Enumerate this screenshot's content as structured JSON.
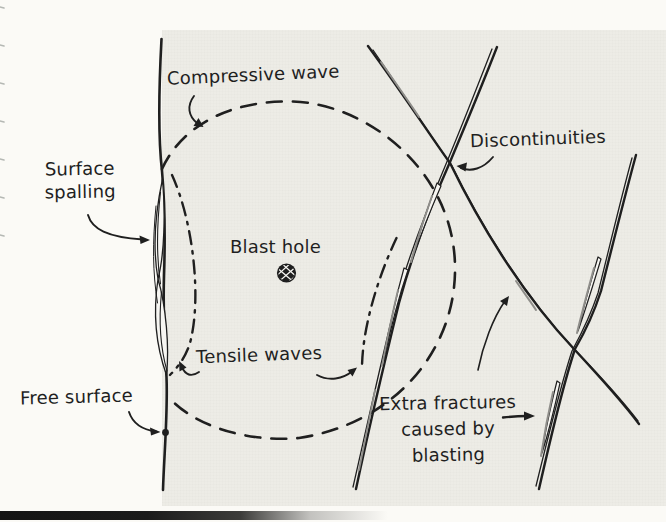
{
  "labels": {
    "compressive_wave": "Compressive wave",
    "discontinuities": "Discontinuities",
    "surface_spalling": {
      "line1": "Surface",
      "line2": "spalling"
    },
    "blast_hole": "Blast hole",
    "tensile_waves": "Tensile waves",
    "free_surface": "Free surface",
    "extra_fractures": {
      "line1": "Extra fractures",
      "line2": "caused by",
      "line3": "blasting"
    }
  },
  "icons": {
    "blast_hole": "hatched-filled-circle",
    "free_surface_marker": "filled-dot"
  },
  "colors": {
    "ink": "#1f1f1f",
    "paper": "#fbfaf6",
    "rock_tint": "#edece6",
    "sliver_shading": "#8f8e8a",
    "scan_edge_bar": "#141414"
  },
  "line_styles": {
    "compressive_wave_front": "dashed circle",
    "tensile_wave_front": "dash-dot arc",
    "discontinuity": "solid double-stroke",
    "free_surface": "solid vertical"
  }
}
